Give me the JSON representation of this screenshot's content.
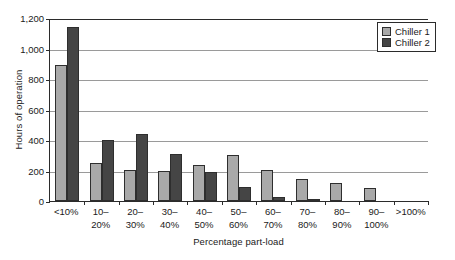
{
  "chart_data": {
    "type": "bar",
    "title": "",
    "xlabel": "Percentage part-load",
    "ylabel": "Hours of operation",
    "categories": [
      "<10%",
      "10–\n20%",
      "20–\n30%",
      "30–\n40%",
      "40–\n50%",
      "50–\n60%",
      "60–\n70%",
      "70–\n80%",
      "80–\n90%",
      "90–\n100%",
      ">100%"
    ],
    "series": [
      {
        "name": "Chiller 1",
        "color": "#a9a9a9",
        "values": [
          890,
          248,
          205,
          198,
          235,
          300,
          205,
          142,
          120,
          85,
          0
        ]
      },
      {
        "name": "Chiller 2",
        "color": "#454545",
        "values": [
          1140,
          400,
          440,
          308,
          190,
          90,
          28,
          8,
          0,
          0,
          0
        ]
      }
    ],
    "ylim": [
      0,
      1200
    ],
    "yticks": [
      0,
      200,
      400,
      600,
      800,
      1000,
      1200
    ],
    "ytick_labels": [
      "0",
      "200",
      "400",
      "600",
      "800",
      "1,000",
      "1,200"
    ],
    "grid": "horizontal",
    "legend_position": "top-right"
  },
  "legend": {
    "entries": [
      {
        "label": "Chiller 1"
      },
      {
        "label": "Chiller 2"
      }
    ]
  }
}
